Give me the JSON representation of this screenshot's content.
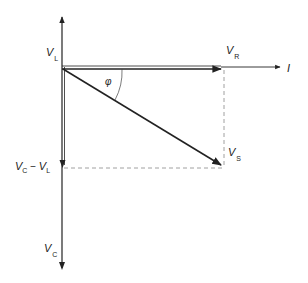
{
  "diagram": {
    "type": "phasor-diagram",
    "labels": {
      "vl": {
        "main": "V",
        "sub": "L"
      },
      "vr": {
        "main": "V",
        "sub": "R"
      },
      "current": {
        "main": "I"
      },
      "vs": {
        "main": "V",
        "sub": "S"
      },
      "phi": {
        "main": "φ"
      },
      "vc_minus_vl": {
        "main1": "V",
        "sub1": "C",
        "minus": " − ",
        "main2": "V",
        "sub2": "L"
      },
      "vc": {
        "main": "V",
        "sub": "C"
      }
    },
    "colors": {
      "line": "#222222",
      "dashed": "#888888"
    }
  }
}
